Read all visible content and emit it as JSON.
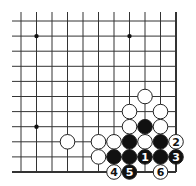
{
  "diagram": {
    "type": "go-board-fragment",
    "columns": 11,
    "rows": 11,
    "edges": [
      "right",
      "bottom"
    ],
    "colors": {
      "line": "#333333",
      "black_stone": "#111111",
      "white_stone": "#ffffff",
      "stone_outline": "#222222"
    },
    "star_points": [
      {
        "col": 1,
        "row": 1
      },
      {
        "col": 7,
        "row": 1
      },
      {
        "col": 1,
        "row": 7
      }
    ],
    "stones": [
      {
        "color": "white",
        "col": 8,
        "row": 5,
        "label": ""
      },
      {
        "color": "white",
        "col": 7,
        "row": 6,
        "label": ""
      },
      {
        "color": "white",
        "col": 9,
        "row": 6,
        "label": ""
      },
      {
        "color": "white",
        "col": 7,
        "row": 7,
        "label": ""
      },
      {
        "color": "black",
        "col": 8,
        "row": 7,
        "label": ""
      },
      {
        "color": "white",
        "col": 9,
        "row": 7,
        "label": ""
      },
      {
        "color": "white",
        "col": 3,
        "row": 8,
        "label": ""
      },
      {
        "color": "white",
        "col": 5,
        "row": 8,
        "label": ""
      },
      {
        "color": "white",
        "col": 6,
        "row": 8,
        "label": ""
      },
      {
        "color": "black",
        "col": 7,
        "row": 8,
        "label": ""
      },
      {
        "color": "white",
        "col": 8,
        "row": 8,
        "label": ""
      },
      {
        "color": "black",
        "col": 9,
        "row": 8,
        "label": ""
      },
      {
        "color": "white",
        "col": 10,
        "row": 8,
        "label": "2"
      },
      {
        "color": "white",
        "col": 5,
        "row": 9,
        "label": ""
      },
      {
        "color": "black",
        "col": 6,
        "row": 9,
        "label": ""
      },
      {
        "color": "black",
        "col": 7,
        "row": 9,
        "label": ""
      },
      {
        "color": "black",
        "col": 8,
        "row": 9,
        "label": "1"
      },
      {
        "color": "black",
        "col": 9,
        "row": 9,
        "label": ""
      },
      {
        "color": "black",
        "col": 10,
        "row": 9,
        "label": "3"
      },
      {
        "color": "white",
        "col": 6,
        "row": 10,
        "label": "4"
      },
      {
        "color": "black",
        "col": 7,
        "row": 10,
        "label": "5"
      },
      {
        "color": "white",
        "col": 9,
        "row": 10,
        "label": "6"
      }
    ]
  }
}
